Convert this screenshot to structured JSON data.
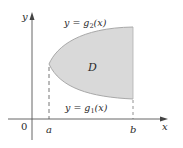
{
  "diagram": {
    "type": "region-between-curves",
    "axes": {
      "x_label": "x",
      "y_label": "y",
      "origin_label": "0"
    },
    "bounds": {
      "left_label": "a",
      "right_label": "b"
    },
    "region": {
      "label": "D",
      "fill_color": "#d9d9d9",
      "edge_color": "#9a9a9a"
    },
    "curves": {
      "upper": {
        "label_prefix": "y = g",
        "subscript": "2",
        "label_suffix": "(x)"
      },
      "lower": {
        "label_prefix": "y = g",
        "subscript": "1",
        "label_suffix": "(x)"
      }
    },
    "colors": {
      "axis": "#555555",
      "text": "#2a2a2a",
      "dashed": "#666666"
    }
  }
}
